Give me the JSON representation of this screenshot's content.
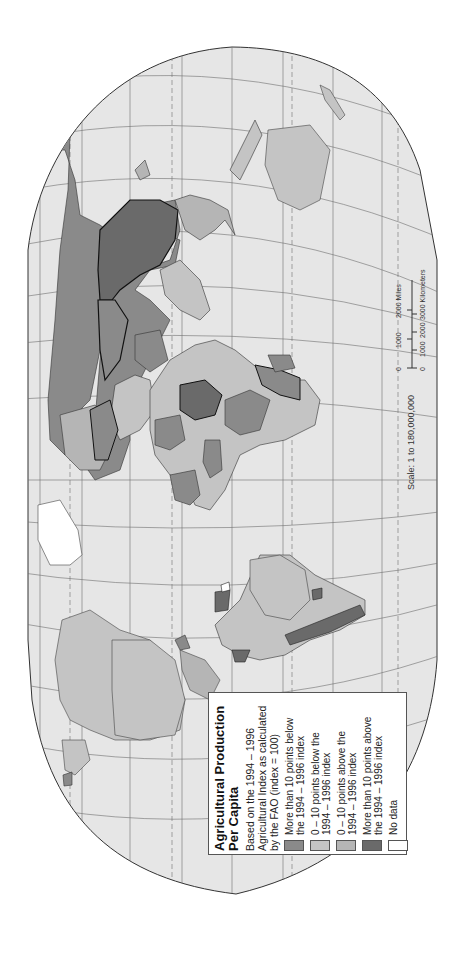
{
  "map": {
    "title": "Agricultural Production Per Capita",
    "title_line1": "Agricultural Production",
    "title_line2": "Per Capita",
    "orientation": "rotated 90° counter-clockwise (north to the left)",
    "colors": {
      "ocean": "#e6e6e6",
      "graticule": "#6e6e6e",
      "outline": "#333333",
      "more_below": "#8a8a8a",
      "zero_ten_below": "#c4c4c4",
      "zero_ten_above": "#b5b5b5",
      "more_above": "#6a6a6a",
      "no_data": "#ffffff"
    }
  },
  "legend": {
    "title_line1": "Agricultural Production",
    "title_line2": "Per Capita",
    "subtitle": "Based on the 1994 – 1996 Agricultural Index as calculated by the FAO (index = 100)",
    "sub_line1": "Based on the 1994 – 1996",
    "sub_line2": "Agricultural Index as calculated",
    "sub_line3": "by the FAO (index = 100)",
    "items": [
      {
        "label_line1": "More than 10 points below",
        "label_line2": "the 1994 – 1996 index",
        "color": "#8a8a8a"
      },
      {
        "label_line1": "0 – 10 points below the",
        "label_line2": "1994 – 1996 index",
        "color": "#c4c4c4"
      },
      {
        "label_line1": "0 – 10 points above the",
        "label_line2": "1994 – 1996 index",
        "color": "#b5b5b5"
      },
      {
        "label_line1": "More than 10 points above",
        "label_line2": "the 1994 – 1996 index",
        "color": "#6a6a6a"
      },
      {
        "label_line1": "No data",
        "label_line2": "",
        "color": "#ffffff"
      }
    ]
  },
  "scale": {
    "label": "Scale:  1 to 180,000,000",
    "miles_ticks": [
      "0",
      "1000",
      "2000 Miles"
    ],
    "km_ticks": [
      "0",
      "1000",
      "2000",
      "3000 Kilometers"
    ]
  }
}
